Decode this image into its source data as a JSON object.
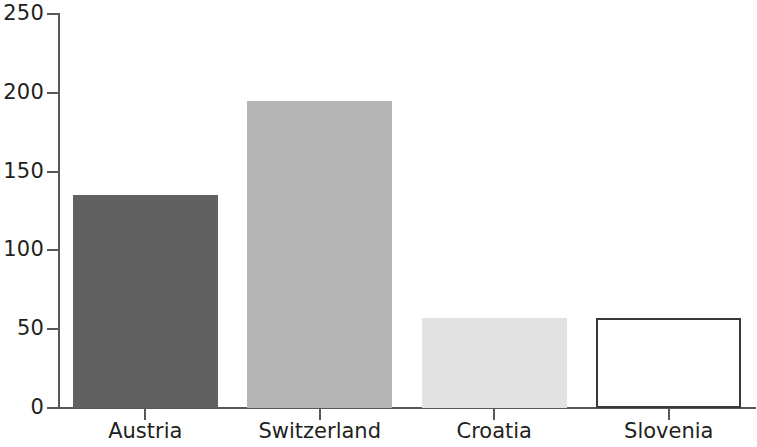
{
  "chart_data": {
    "type": "bar",
    "title": "",
    "subtitle": "",
    "xlabel": "",
    "ylabel": "",
    "categories": [
      "Austria",
      "Switzerland",
      "Croatia",
      "Slovenia"
    ],
    "values": [
      135,
      195,
      57,
      57
    ],
    "series": [
      {
        "name": "",
        "values": [
          135,
          195,
          57,
          57
        ]
      }
    ],
    "bar_colors": [
      "#616161",
      "#b5b5b5",
      "#e2e2e2",
      "#ffffff"
    ],
    "bar_border_colors": [
      "none",
      "none",
      "none",
      "#3a3a3c"
    ],
    "ylim": [
      0,
      250
    ],
    "ytick_labels": [
      "250",
      "200",
      "150",
      "100",
      "50",
      "0"
    ],
    "ytick_values": [
      250,
      200,
      150,
      100,
      50,
      0
    ],
    "grid": false,
    "legend": false,
    "legend_position": "none",
    "annotations": []
  },
  "axis": {
    "axis_color": "#58585a",
    "tick_label_color": "#231f20"
  }
}
